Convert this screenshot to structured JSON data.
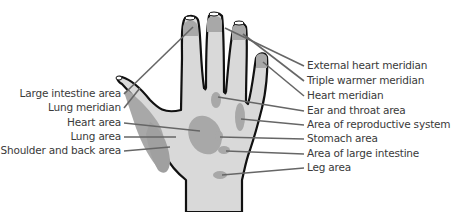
{
  "diagram": {
    "type": "hand-reflexology-map",
    "colors": {
      "skin": "#d9d9d9",
      "zone": "#a8a8a8",
      "outline": "#111111",
      "leader_line": "#666666",
      "text": "#3a3a3a"
    },
    "left_labels": [
      {
        "text": "Large intestine area",
        "y": 93
      },
      {
        "text": "Lung meridian",
        "y": 107
      },
      {
        "text": "Heart area",
        "y": 122
      },
      {
        "text": "Lung area",
        "y": 136
      },
      {
        "text": "Shoulder and back area",
        "y": 150
      }
    ],
    "right_labels": [
      {
        "text": "External heart meridian",
        "y": 65
      },
      {
        "text": "Triple warmer meridian",
        "y": 80
      },
      {
        "text": "Heart meridian",
        "y": 95
      },
      {
        "text": "Ear and throat area",
        "y": 110
      },
      {
        "text": "Area of reproductive system",
        "y": 124
      },
      {
        "text": "Stomach area",
        "y": 138
      },
      {
        "text": "Area of large intestine",
        "y": 153
      },
      {
        "text": "Leg area",
        "y": 167
      }
    ]
  }
}
